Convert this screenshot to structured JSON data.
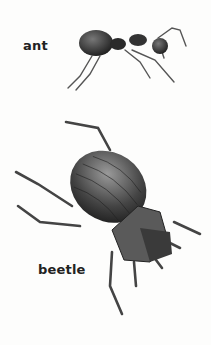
{
  "labels": {
    "ant": "ant",
    "beetle": "beetle"
  },
  "illustrations": [
    {
      "name": "ant-drawing",
      "subject": "ant"
    },
    {
      "name": "beetle-drawing",
      "subject": "beetle"
    }
  ],
  "colors": {
    "background": "#fdfdfc",
    "ink": "#222222"
  }
}
